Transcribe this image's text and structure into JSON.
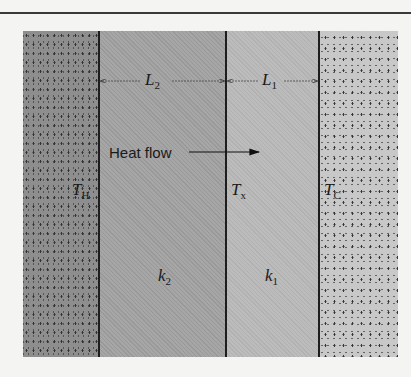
{
  "diagram": {
    "regions": [
      {
        "id": "hot-reservoir",
        "label": "T_H"
      },
      {
        "id": "material-2",
        "label": "k_2",
        "thickness": "L_2"
      },
      {
        "id": "material-1",
        "label": "k_1",
        "thickness": "L_1"
      },
      {
        "id": "cold-reservoir",
        "label": "T_C"
      }
    ],
    "labels": {
      "L2": {
        "base": "L",
        "sub": "2"
      },
      "L1": {
        "base": "L",
        "sub": "1"
      },
      "TH": {
        "base": "T",
        "sub": "H"
      },
      "Tx": {
        "base": "T",
        "sub": "x"
      },
      "TC": {
        "base": "T",
        "sub": "C"
      },
      "k2": {
        "base": "k",
        "sub": "2"
      },
      "k1": {
        "base": "k",
        "sub": "1"
      }
    },
    "heat_flow_label": "Heat flow"
  }
}
